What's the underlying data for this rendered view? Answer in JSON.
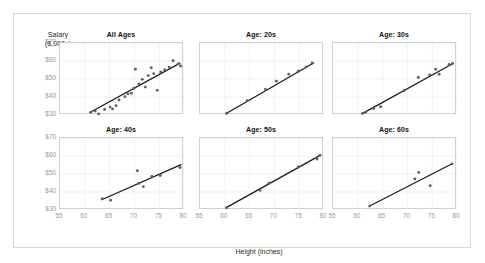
{
  "chart_data": {
    "type": "scatter",
    "title": "",
    "xlabel": "Height (inches)",
    "ylabel": "Salary ($,000s)",
    "xlim": [
      55,
      80
    ],
    "ylim": [
      30,
      70
    ],
    "xticks": [
      "55",
      "60",
      "65",
      "70",
      "75",
      "80"
    ],
    "xtick_values": [
      55,
      60,
      65,
      70,
      75,
      80
    ],
    "yticks": [
      "$30",
      "$40",
      "$50",
      "$60",
      "$70"
    ],
    "ytick_values": [
      30,
      40,
      50,
      60,
      70
    ],
    "grid": true,
    "legend": "none",
    "layout": "2 rows x 3 columns of faceted scatter panels, each with linear trend line",
    "panels": [
      {
        "title": "All Ages",
        "points": [
          {
            "x": 61.2,
            "y": 31.5
          },
          {
            "x": 62.1,
            "y": 32.2
          },
          {
            "x": 62.8,
            "y": 30.6
          },
          {
            "x": 64.0,
            "y": 33.1
          },
          {
            "x": 65.1,
            "y": 34.4
          },
          {
            "x": 65.6,
            "y": 33.4
          },
          {
            "x": 66.3,
            "y": 35.2
          },
          {
            "x": 66.9,
            "y": 38.3
          },
          {
            "x": 68.1,
            "y": 40.2
          },
          {
            "x": 68.7,
            "y": 41.8
          },
          {
            "x": 69.4,
            "y": 42.1
          },
          {
            "x": 69.9,
            "y": 44.9
          },
          {
            "x": 70.2,
            "y": 55.4
          },
          {
            "x": 70.9,
            "y": 47.3
          },
          {
            "x": 71.6,
            "y": 49.8
          },
          {
            "x": 72.2,
            "y": 45.5
          },
          {
            "x": 72.8,
            "y": 51.9
          },
          {
            "x": 73.4,
            "y": 56.3
          },
          {
            "x": 73.9,
            "y": 53.0
          },
          {
            "x": 74.6,
            "y": 43.7
          },
          {
            "x": 75.3,
            "y": 53.9
          },
          {
            "x": 76.1,
            "y": 55.1
          },
          {
            "x": 77.0,
            "y": 56.6
          },
          {
            "x": 77.8,
            "y": 60.1
          },
          {
            "x": 78.8,
            "y": 58.4
          },
          {
            "x": 79.3,
            "y": 57.2
          }
        ],
        "fit": {
          "x0": 61.0,
          "y0": 31.4,
          "x1": 79.2,
          "y1": 58.8
        }
      },
      {
        "title": "Age: 20s",
        "points": [
          {
            "x": 60.4,
            "y": 31.0
          },
          {
            "x": 64.5,
            "y": 38.0
          },
          {
            "x": 68.2,
            "y": 44.2
          },
          {
            "x": 70.4,
            "y": 48.8
          },
          {
            "x": 72.9,
            "y": 52.7
          },
          {
            "x": 74.8,
            "y": 54.3
          },
          {
            "x": 76.4,
            "y": 56.7
          },
          {
            "x": 77.6,
            "y": 58.9
          }
        ],
        "fit": {
          "x0": 60.2,
          "y0": 30.7,
          "x1": 77.9,
          "y1": 58.9
        }
      },
      {
        "title": "Age: 30s",
        "points": [
          {
            "x": 61.0,
            "y": 31.0
          },
          {
            "x": 61.6,
            "y": 31.6
          },
          {
            "x": 63.2,
            "y": 33.6
          },
          {
            "x": 64.6,
            "y": 34.6
          },
          {
            "x": 69.3,
            "y": 43.5
          },
          {
            "x": 72.2,
            "y": 50.8
          },
          {
            "x": 74.5,
            "y": 52.2
          },
          {
            "x": 75.7,
            "y": 55.4
          },
          {
            "x": 76.4,
            "y": 52.6
          },
          {
            "x": 78.4,
            "y": 58.1
          },
          {
            "x": 79.1,
            "y": 58.6
          }
        ],
        "fit": {
          "x0": 60.8,
          "y0": 30.6,
          "x1": 79.2,
          "y1": 58.6
        }
      },
      {
        "title": "Age: 40s",
        "points": [
          {
            "x": 63.5,
            "y": 36.3
          },
          {
            "x": 65.2,
            "y": 35.4
          },
          {
            "x": 70.6,
            "y": 51.8
          },
          {
            "x": 70.9,
            "y": 44.9
          },
          {
            "x": 71.8,
            "y": 43.0
          },
          {
            "x": 73.5,
            "y": 48.6
          },
          {
            "x": 75.2,
            "y": 49.2
          },
          {
            "x": 79.2,
            "y": 53.6
          }
        ],
        "fit": {
          "x0": 63.4,
          "y0": 35.7,
          "x1": 79.4,
          "y1": 55.2
        }
      },
      {
        "title": "Age: 50s",
        "points": [
          {
            "x": 60.4,
            "y": 31.3
          },
          {
            "x": 67.1,
            "y": 41.0
          },
          {
            "x": 68.9,
            "y": 44.9
          },
          {
            "x": 74.8,
            "y": 53.9
          },
          {
            "x": 78.6,
            "y": 58.3
          },
          {
            "x": 79.2,
            "y": 60.4
          }
        ],
        "fit": {
          "x0": 60.2,
          "y0": 31.2,
          "x1": 79.3,
          "y1": 60.5
        }
      },
      {
        "title": "Age: 60s",
        "points": [
          {
            "x": 62.4,
            "y": 32.2
          },
          {
            "x": 71.5,
            "y": 47.2
          },
          {
            "x": 72.3,
            "y": 50.9
          },
          {
            "x": 74.6,
            "y": 43.5
          },
          {
            "x": 79.0,
            "y": 55.6
          }
        ],
        "fit": {
          "x0": 62.3,
          "y0": 32.1,
          "x1": 79.1,
          "y1": 55.8
        }
      }
    ]
  }
}
